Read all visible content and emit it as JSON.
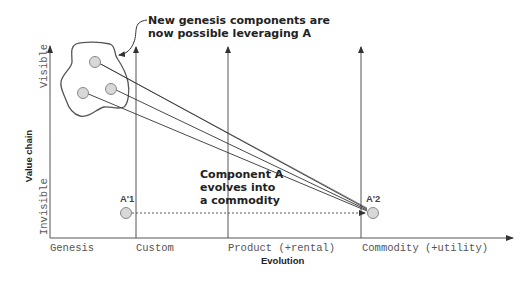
{
  "diagram": {
    "type": "wardley-map",
    "y_axis": {
      "title": "Value chain",
      "top_label": "Visible",
      "bottom_label": "Invisible"
    },
    "x_axis": {
      "title": "Evolution",
      "stages": [
        "Genesis",
        "Custom",
        "Product (+rental)",
        "Commodity (+utility)"
      ]
    },
    "annotations": {
      "genesis_note_line1": "New genesis components are",
      "genesis_note_line2": "now possible leveraging A",
      "evolve_note_line1": "Component A",
      "evolve_note_line2": "evolves into",
      "evolve_note_line3": "a commodity"
    },
    "components": [
      {
        "id": "a1",
        "label": "A'1",
        "stage": "Custom-left"
      },
      {
        "id": "a2",
        "label": "A'2",
        "stage": "Commodity"
      },
      {
        "id": "g1",
        "label": "",
        "stage": "Genesis"
      },
      {
        "id": "g2",
        "label": "",
        "stage": "Genesis"
      },
      {
        "id": "g3",
        "label": "",
        "stage": "Genesis"
      }
    ],
    "colors": {
      "line": "#555555",
      "node_fill": "#d8d8d8",
      "node_stroke": "#888888",
      "text": "#222222"
    }
  }
}
